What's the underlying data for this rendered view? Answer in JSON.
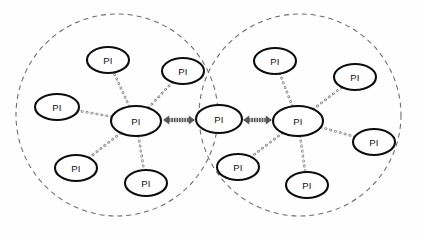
{
  "diagram": {
    "node_label": "PI",
    "background_color": "#fefefe",
    "node_fill": "#ffffff",
    "node_stroke": "#0d0d0d",
    "cluster_stroke": "#6b6b6b",
    "edge_stroke": "#8a8a8a",
    "arrow_color": "#585858",
    "clusters": [
      {
        "id": "cluster-left",
        "center_x": 117,
        "center_y": 115,
        "radius": 101,
        "style": "dashed"
      },
      {
        "id": "cluster-right",
        "center_x": 300,
        "center_y": 115,
        "radius": 101,
        "style": "dashed"
      }
    ],
    "nodes": [
      {
        "id": "left-hub",
        "label": "PI",
        "cx": 136,
        "cy": 121,
        "rx": 25,
        "ry": 15,
        "role": "hub",
        "cluster": "cluster-left"
      },
      {
        "id": "left-sat-top",
        "label": "PI",
        "cx": 108,
        "cy": 60,
        "rx": 21,
        "ry": 13,
        "role": "satellite",
        "cluster": "cluster-left"
      },
      {
        "id": "left-sat-ne",
        "label": "PI",
        "cx": 183,
        "cy": 71,
        "rx": 21,
        "ry": 13,
        "role": "satellite",
        "cluster": "cluster-left"
      },
      {
        "id": "left-sat-west",
        "label": "PI",
        "cx": 57,
        "cy": 107,
        "rx": 22,
        "ry": 13,
        "role": "satellite",
        "cluster": "cluster-left"
      },
      {
        "id": "left-sat-sw",
        "label": "PI",
        "cx": 76,
        "cy": 168,
        "rx": 21,
        "ry": 13,
        "role": "satellite",
        "cluster": "cluster-left"
      },
      {
        "id": "left-sat-south",
        "label": "PI",
        "cx": 146,
        "cy": 183,
        "rx": 21,
        "ry": 13,
        "role": "satellite",
        "cluster": "cluster-left"
      },
      {
        "id": "shared-node",
        "label": "PI",
        "cx": 219,
        "cy": 119,
        "rx": 23,
        "ry": 14,
        "role": "shared",
        "cluster": "overlap"
      },
      {
        "id": "right-hub",
        "label": "PI",
        "cx": 298,
        "cy": 121,
        "rx": 25,
        "ry": 15,
        "role": "hub",
        "cluster": "cluster-right"
      },
      {
        "id": "right-sat-top",
        "label": "PI",
        "cx": 275,
        "cy": 61,
        "rx": 21,
        "ry": 13,
        "role": "satellite",
        "cluster": "cluster-right"
      },
      {
        "id": "right-sat-ne",
        "label": "PI",
        "cx": 355,
        "cy": 77,
        "rx": 21,
        "ry": 13,
        "role": "satellite",
        "cluster": "cluster-right"
      },
      {
        "id": "right-sat-east",
        "label": "PI",
        "cx": 374,
        "cy": 142,
        "rx": 21,
        "ry": 13,
        "role": "satellite",
        "cluster": "cluster-right"
      },
      {
        "id": "right-sat-sw",
        "label": "PI",
        "cx": 238,
        "cy": 167,
        "rx": 21,
        "ry": 13,
        "role": "satellite",
        "cluster": "cluster-right"
      },
      {
        "id": "right-sat-south",
        "label": "PI",
        "cx": 307,
        "cy": 185,
        "rx": 21,
        "ry": 13,
        "role": "satellite",
        "cluster": "cluster-right"
      }
    ],
    "edges": [
      {
        "id": "edge-left-top",
        "from": "left-hub",
        "to": "left-sat-top",
        "style": "dotted"
      },
      {
        "id": "edge-left-ne",
        "from": "left-hub",
        "to": "left-sat-ne",
        "style": "dotted"
      },
      {
        "id": "edge-left-west",
        "from": "left-hub",
        "to": "left-sat-west",
        "style": "dotted"
      },
      {
        "id": "edge-left-sw",
        "from": "left-hub",
        "to": "left-sat-sw",
        "style": "dotted"
      },
      {
        "id": "edge-left-south",
        "from": "left-hub",
        "to": "left-sat-south",
        "style": "dotted"
      },
      {
        "id": "edge-right-top",
        "from": "right-hub",
        "to": "right-sat-top",
        "style": "dotted"
      },
      {
        "id": "edge-right-ne",
        "from": "right-hub",
        "to": "right-sat-ne",
        "style": "dotted"
      },
      {
        "id": "edge-right-east",
        "from": "right-hub",
        "to": "right-sat-east",
        "style": "dotted"
      },
      {
        "id": "edge-right-sw",
        "from": "right-hub",
        "to": "right-sat-sw",
        "style": "dotted"
      },
      {
        "id": "edge-right-south",
        "from": "right-hub",
        "to": "right-sat-south",
        "style": "dotted"
      }
    ],
    "bridges": [
      {
        "id": "bridge-left",
        "from": "left-hub",
        "to": "shared-node",
        "style": "double-arrow",
        "x1": 163,
        "x2": 195,
        "y": 120
      },
      {
        "id": "bridge-right",
        "from": "shared-node",
        "to": "right-hub",
        "style": "double-arrow",
        "x1": 243,
        "x2": 272,
        "y": 120
      }
    ]
  }
}
